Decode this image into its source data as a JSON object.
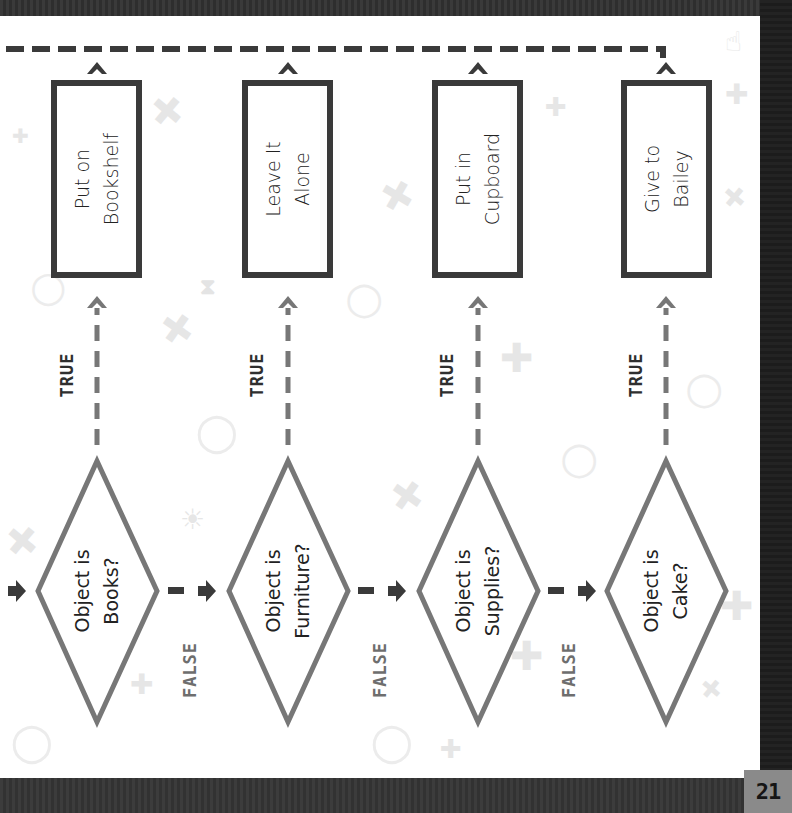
{
  "page": {
    "number": "21",
    "colors": {
      "frame": "#2b2b2b",
      "page_bg": "#ffffff",
      "box_border": "#3a3a3a",
      "diamond_border": "#777777",
      "true_arrow": "#777777",
      "false_arrow": "#3a3a3a",
      "true_label": "#2f2f2f",
      "false_label": "#6e6e6e",
      "page_number_bg": "#8a8a8a"
    }
  },
  "flowchart": {
    "orientation": "rotated 90deg counter-clockwise",
    "decisions": [
      {
        "line1": "Object is",
        "line2": "Books?"
      },
      {
        "line1": "Object is",
        "line2": "Furniture?"
      },
      {
        "line1": "Object is",
        "line2": "Supplies?"
      },
      {
        "line1": "Object is",
        "line2": "Cake?"
      }
    ],
    "actions": [
      {
        "line1": "Put on",
        "line2": "Bookshelf"
      },
      {
        "line1": "Leave It",
        "line2": "Alone"
      },
      {
        "line1": "Put in",
        "line2": "Cupboard"
      },
      {
        "line1": "Give to",
        "line2": "Bailey"
      }
    ],
    "true_labels": [
      "TRUE",
      "TRUE",
      "TRUE",
      "TRUE"
    ],
    "false_labels": [
      "FALSE",
      "FALSE",
      "FALSE"
    ]
  },
  "background_icons": [
    "plus-icon",
    "magnifier-icon",
    "lightbulb-icon",
    "hourglass-icon",
    "pointer-hand-icon",
    "cursor-arrow-icon"
  ]
}
